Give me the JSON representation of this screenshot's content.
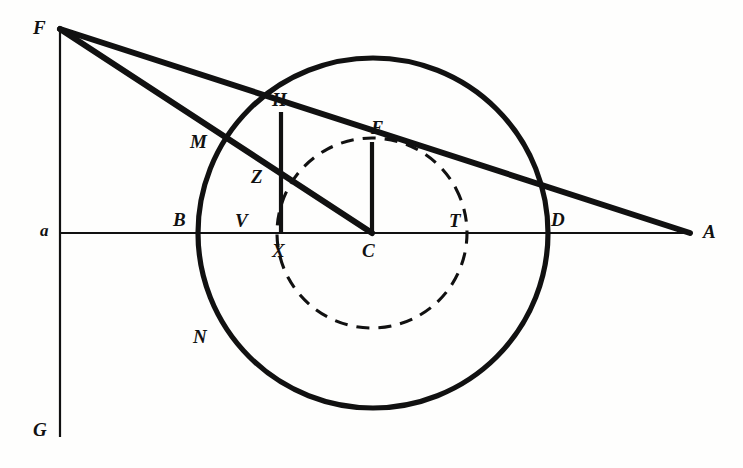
{
  "figure": {
    "canvas": {
      "width": 743,
      "height": 468
    },
    "background_color": "#fefefd",
    "ink_color": "#111111"
  },
  "labels": [
    {
      "id": "F",
      "text": "F",
      "x": 33,
      "y": 18,
      "size": "normal"
    },
    {
      "id": "H",
      "text": "H",
      "x": 272,
      "y": 90,
      "size": "normal"
    },
    {
      "id": "E",
      "text": "E",
      "x": 371,
      "y": 118,
      "size": "normal"
    },
    {
      "id": "M",
      "text": "M",
      "x": 190,
      "y": 132,
      "size": "normal"
    },
    {
      "id": "Z",
      "text": "Z",
      "x": 251,
      "y": 167,
      "size": "normal"
    },
    {
      "id": "a",
      "text": "a",
      "x": 40,
      "y": 222,
      "size": "small"
    },
    {
      "id": "B",
      "text": "B",
      "x": 173,
      "y": 210,
      "size": "normal"
    },
    {
      "id": "V",
      "text": "V",
      "x": 235,
      "y": 211,
      "size": "normal"
    },
    {
      "id": "T",
      "text": "T",
      "x": 449,
      "y": 211,
      "size": "normal"
    },
    {
      "id": "D",
      "text": "D",
      "x": 551,
      "y": 210,
      "size": "normal"
    },
    {
      "id": "A",
      "text": "A",
      "x": 703,
      "y": 222,
      "size": "normal"
    },
    {
      "id": "X",
      "text": "X",
      "x": 272,
      "y": 241,
      "size": "normal"
    },
    {
      "id": "C",
      "text": "C",
      "x": 362,
      "y": 241,
      "size": "normal"
    },
    {
      "id": "N",
      "text": "N",
      "x": 193,
      "y": 327,
      "size": "normal"
    },
    {
      "id": "G",
      "text": "G",
      "x": 33,
      "y": 420,
      "size": "normal"
    }
  ],
  "points": {
    "F": {
      "x": 60,
      "y": 29
    },
    "G": {
      "x": 60,
      "y": 437
    },
    "a": {
      "x": 60,
      "y": 233
    },
    "A": {
      "x": 690,
      "y": 233
    },
    "B": {
      "x": 199,
      "y": 233
    },
    "D": {
      "x": 548,
      "y": 233
    },
    "C": {
      "x": 372,
      "y": 233
    },
    "X": {
      "x": 281,
      "y": 233
    },
    "V": {
      "x": 258,
      "y": 233
    },
    "T": {
      "x": 467,
      "y": 233
    },
    "H": {
      "x": 281,
      "y": 113
    },
    "E": {
      "x": 372,
      "y": 143
    },
    "Z": {
      "x": 281,
      "y": 183
    },
    "M": {
      "x": 212,
      "y": 146
    },
    "N": {
      "x": 222,
      "y": 351
    }
  },
  "shapes": {
    "outer_circle": {
      "cx": 373,
      "cy": 233,
      "r": 175,
      "style": "solid",
      "stroke_width": 5
    },
    "inner_circle": {
      "cx": 372,
      "cy": 233,
      "r": 95,
      "style": "dashed",
      "stroke_width": 3,
      "dash": "13 9"
    },
    "vertical_axis": {
      "x": 60,
      "y1": 29,
      "y2": 437,
      "label_top": "F",
      "label_bottom": "G",
      "stroke_width": 2
    },
    "horizontal_axis": {
      "y": 233,
      "x1": 60,
      "x2": 690,
      "label_left": "a",
      "label_right": "A",
      "stroke_width": 2
    }
  },
  "segments": [
    {
      "id": "F-to-A-through-H-E-D",
      "from": "F",
      "to": "A",
      "style": "solid",
      "stroke_width": 6
    },
    {
      "id": "F-to-C-through-M-Z",
      "from": "F",
      "to": "C",
      "style": "solid",
      "stroke_width": 6
    },
    {
      "id": "H-to-X",
      "from": "H",
      "to": "X",
      "style": "solid",
      "stroke_width": 4
    },
    {
      "id": "E-to-C",
      "from": "E",
      "to": "C",
      "style": "solid",
      "stroke_width": 4
    }
  ]
}
